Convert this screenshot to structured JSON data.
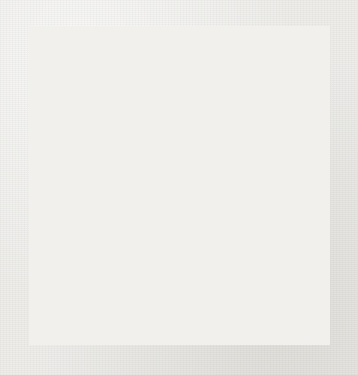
{
  "figure": {
    "kind": "go-board-diagram",
    "background_color": "#eeedea",
    "board_color": "#f1f0ec",
    "line_color": "#1a1a18",
    "black_stone_color": "#100f0d",
    "white_stone_color": "#fdfdfb"
  },
  "board": {
    "size": 9,
    "columns": 9,
    "rows": 9,
    "origin_x": 8,
    "origin_y": 8,
    "spacing_x": 35.6,
    "spacing_y": 37.8,
    "stone_diameter": 34,
    "edge_line_width": 3.0,
    "inner_line_width": 1.6,
    "star_points": [
      {
        "col": 3,
        "row": 3
      },
      {
        "col": 7,
        "row": 3
      },
      {
        "col": 3,
        "row": 7
      },
      {
        "col": 7,
        "row": 7
      }
    ],
    "star_point_radius": 3.2,
    "visible_star_points": [
      {
        "col": 7,
        "row": 3
      },
      {
        "col": 3,
        "row": 7
      }
    ],
    "stones": [
      {
        "col": 3,
        "row": 2,
        "color": "black"
      },
      {
        "col": 4,
        "row": 2,
        "color": "white"
      },
      {
        "col": 3,
        "row": 3,
        "color": "black"
      },
      {
        "col": 4,
        "row": 3,
        "color": "white"
      },
      {
        "col": 8,
        "row": 3,
        "color": "white"
      },
      {
        "col": 1,
        "row": 4,
        "color": "black"
      },
      {
        "col": 2,
        "row": 4,
        "color": "black"
      },
      {
        "col": 3,
        "row": 4,
        "color": "black"
      },
      {
        "col": 4,
        "row": 4,
        "color": "black"
      },
      {
        "col": 5,
        "row": 4,
        "color": "white"
      },
      {
        "col": 6,
        "row": 4,
        "color": "white"
      },
      {
        "col": 8,
        "row": 4,
        "color": "white"
      },
      {
        "col": 1,
        "row": 5,
        "color": "black"
      },
      {
        "col": 2,
        "row": 5,
        "color": "white"
      },
      {
        "col": 3,
        "row": 5,
        "color": "white"
      },
      {
        "col": 4,
        "row": 5,
        "color": "black"
      },
      {
        "col": 5,
        "row": 5,
        "color": "black"
      },
      {
        "col": 6,
        "row": 5,
        "color": "white"
      },
      {
        "col": 7,
        "row": 5,
        "color": "white"
      },
      {
        "col": 8,
        "row": 5,
        "color": "black"
      },
      {
        "col": 1,
        "row": 6,
        "color": "white"
      },
      {
        "col": 3,
        "row": 6,
        "color": "white"
      },
      {
        "col": 4,
        "row": 6,
        "color": "white"
      },
      {
        "col": 5,
        "row": 6,
        "color": "black"
      },
      {
        "col": 6,
        "row": 6,
        "color": "white"
      },
      {
        "col": 8,
        "row": 6,
        "color": "black"
      },
      {
        "col": 2,
        "row": 7,
        "color": "white"
      },
      {
        "col": 4,
        "row": 7,
        "color": "white"
      },
      {
        "col": 5,
        "row": 7,
        "color": "black"
      },
      {
        "col": 7,
        "row": 7,
        "color": "black"
      },
      {
        "col": 3,
        "row": 8,
        "color": "white"
      },
      {
        "col": 4,
        "row": 8,
        "color": "black"
      },
      {
        "col": 6,
        "row": 8,
        "color": "black"
      },
      {
        "col": 4,
        "row": 9,
        "color": "black"
      }
    ],
    "stone_counts": {
      "black": 18,
      "white": 16,
      "total": 34
    }
  }
}
